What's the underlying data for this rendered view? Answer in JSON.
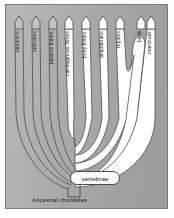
{
  "figure": {
    "type": "phylogenetic-tree",
    "root_label": "Ancestral chordates",
    "node_label": "vertebrae",
    "background_color": "#aaaaa7",
    "branch_color": "#ffffff",
    "outline_color": "#3a3a3a",
    "branches": [
      {
        "label": "lancelets",
        "tip_x": 14,
        "style": "thin"
      },
      {
        "label": "tunicates",
        "tip_x": 31,
        "style": "thin"
      },
      {
        "label": "jawless fishes",
        "tip_x": 48,
        "style": "thin"
      },
      {
        "label": "cartilaginous fishes",
        "tip_x": 65,
        "style": "thick"
      },
      {
        "label": "bony fishes",
        "tip_x": 82,
        "style": "thick"
      },
      {
        "label": "amphibians",
        "tip_x": 99,
        "style": "thick"
      },
      {
        "label": "reptiles",
        "tip_x": 116,
        "style": "thick"
      },
      {
        "label": "birds",
        "tip_x": 133,
        "style": "thick"
      },
      {
        "label": "mammals",
        "tip_x": 150,
        "style": "thick"
      }
    ]
  }
}
